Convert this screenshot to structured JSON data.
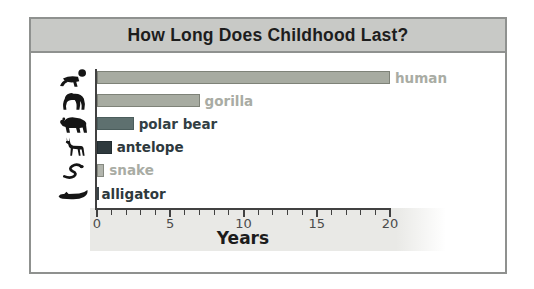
{
  "title_bar": {
    "title": "How Long Does Childhood Last?"
  },
  "chart_data": {
    "type": "bar",
    "orientation": "horizontal",
    "title": "How Long Does Childhood Last?",
    "xlabel": "Years",
    "xlim": [
      0,
      20
    ],
    "major_ticks": [
      0,
      5,
      10,
      15,
      20
    ],
    "minor_tick_step": 1,
    "grid": false,
    "legend": "none",
    "categories": [
      "human",
      "gorilla",
      "polar bear",
      "antelope",
      "snake",
      "alligator"
    ],
    "values": [
      20,
      7,
      2.5,
      1,
      0.5,
      0.1
    ],
    "rows": [
      {
        "category": "human",
        "value": 20,
        "icon": "baby-icon",
        "bar_fill": "#a7aba1",
        "bar_border": "#7e8278",
        "label_color": "#a9aca4"
      },
      {
        "category": "gorilla",
        "value": 7,
        "icon": "gorilla-icon",
        "bar_fill": "#a7aba1",
        "bar_border": "#7e8278",
        "label_color": "#a9aca4"
      },
      {
        "category": "polar bear",
        "value": 2.5,
        "icon": "polar-bear-icon",
        "bar_fill": "#5e706f",
        "bar_border": "#4b5d5c",
        "label_color": "#333f44"
      },
      {
        "category": "antelope",
        "value": 1,
        "icon": "antelope-icon",
        "bar_fill": "#2e393d",
        "bar_border": "#232d31",
        "label_color": "#2e393d"
      },
      {
        "category": "snake",
        "value": 0.5,
        "icon": "snake-icon",
        "bar_fill": "#b2b5ad",
        "bar_border": "#868a81",
        "label_color": "#a9aca4"
      },
      {
        "category": "alligator",
        "value": 0.1,
        "icon": "alligator-icon",
        "bar_fill": "#3a4448",
        "bar_border": "#3a4448",
        "label_color": "#2e393d"
      }
    ],
    "colors": {
      "axis": "#414141",
      "tick_label": "#4c4c4c",
      "band": "#e9e9e6",
      "title_bar_bg": "#c8c9c6",
      "frame_border": "#8f918f",
      "xlabel_color": "#1c1c1c"
    }
  }
}
